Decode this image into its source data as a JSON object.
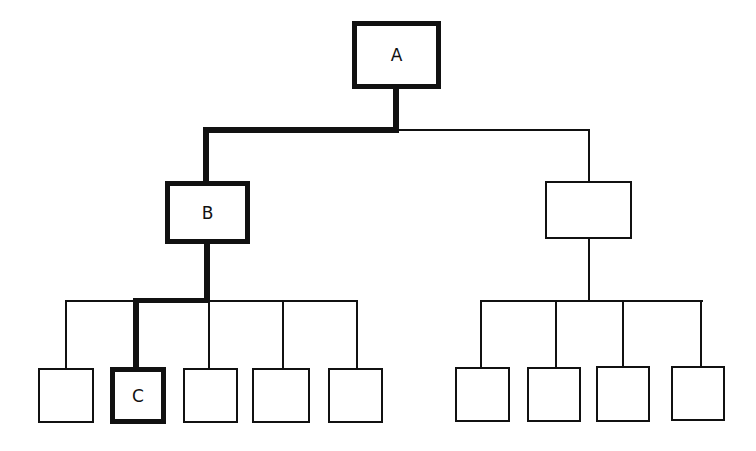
{
  "diagram": {
    "type": "tree-hierarchy",
    "colors": {
      "stroke": "#111111",
      "background": "#ffffff"
    },
    "highlighted_path": [
      "A",
      "B",
      "C"
    ],
    "nodes": [
      {
        "id": "root",
        "label": "A",
        "level": 0,
        "highlighted": true
      },
      {
        "id": "left-mid",
        "label": "B",
        "level": 1,
        "highlighted": true
      },
      {
        "id": "right-mid",
        "label": "",
        "level": 1,
        "highlighted": false
      },
      {
        "id": "left-leaf-1",
        "label": "",
        "level": 2,
        "highlighted": false
      },
      {
        "id": "left-leaf-2",
        "label": "C",
        "level": 2,
        "highlighted": true
      },
      {
        "id": "left-leaf-3",
        "label": "",
        "level": 2,
        "highlighted": false
      },
      {
        "id": "left-leaf-4",
        "label": "",
        "level": 2,
        "highlighted": false
      },
      {
        "id": "left-leaf-5",
        "label": "",
        "level": 2,
        "highlighted": false
      },
      {
        "id": "right-leaf-1",
        "label": "",
        "level": 2,
        "highlighted": false
      },
      {
        "id": "right-leaf-2",
        "label": "",
        "level": 2,
        "highlighted": false
      },
      {
        "id": "right-leaf-3",
        "label": "",
        "level": 2,
        "highlighted": false
      },
      {
        "id": "right-leaf-4",
        "label": "",
        "level": 2,
        "highlighted": false
      }
    ],
    "edges": [
      {
        "from": "A",
        "to": "B",
        "highlighted": true
      },
      {
        "from": "A",
        "to": "right-mid",
        "highlighted": false
      },
      {
        "from": "B",
        "to": "left-leaf-1",
        "highlighted": false
      },
      {
        "from": "B",
        "to": "C",
        "highlighted": true
      },
      {
        "from": "B",
        "to": "left-leaf-3",
        "highlighted": false
      },
      {
        "from": "B",
        "to": "left-leaf-4",
        "highlighted": false
      },
      {
        "from": "B",
        "to": "left-leaf-5",
        "highlighted": false
      },
      {
        "from": "right-mid",
        "to": "right-leaf-1",
        "highlighted": false
      },
      {
        "from": "right-mid",
        "to": "right-leaf-2",
        "highlighted": false
      },
      {
        "from": "right-mid",
        "to": "right-leaf-3",
        "highlighted": false
      },
      {
        "from": "right-mid",
        "to": "right-leaf-4",
        "highlighted": false
      }
    ]
  }
}
